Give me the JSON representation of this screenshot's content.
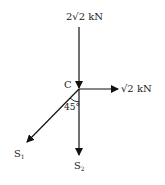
{
  "diagram": {
    "type": "force-diagram",
    "point": {
      "label": "C"
    },
    "forces": [
      {
        "id": "top",
        "label": "2√2 kN",
        "direction": "down"
      },
      {
        "id": "right",
        "label": "√2 kN",
        "direction": "right"
      },
      {
        "id": "s1",
        "label": "S",
        "subscript": "1",
        "direction": "down-left"
      },
      {
        "id": "s2",
        "label": "S",
        "subscript": "2",
        "direction": "down"
      }
    ],
    "angle": {
      "label": "45°"
    },
    "colors": {
      "line": "#111111",
      "text": "#222222"
    }
  }
}
